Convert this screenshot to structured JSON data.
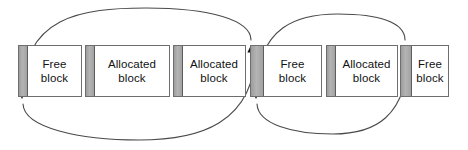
{
  "diagram": {
    "width": 468,
    "height": 150,
    "background_color": "#ffffff",
    "stroke_color": "#4a4a4a",
    "header_fill_color": "#a9a9a9",
    "block_border_color": "#6e6e6e",
    "text_color": "#111111",
    "blocks": [
      {
        "id": "block-1",
        "label": "Free\nblock",
        "type": "free",
        "x": 18,
        "y": 45,
        "width": 64,
        "height": 52,
        "header_width": 9
      },
      {
        "id": "block-2",
        "label": "Allocated\nblock",
        "type": "allocated",
        "x": 85,
        "y": 45,
        "width": 85,
        "height": 52,
        "header_width": 9
      },
      {
        "id": "block-3",
        "label": "Allocated\nblock",
        "type": "allocated",
        "x": 173,
        "y": 45,
        "width": 73,
        "height": 52,
        "header_width": 9
      },
      {
        "id": "block-4",
        "label": "Free\nblock",
        "type": "free",
        "x": 250,
        "y": 45,
        "width": 72,
        "height": 52,
        "header_width": 13
      },
      {
        "id": "block-5",
        "label": "Allocated\nblock",
        "type": "allocated",
        "x": 326,
        "y": 45,
        "width": 72,
        "height": 52,
        "header_width": 9
      },
      {
        "id": "block-6",
        "label": "Free\nblock",
        "type": "free",
        "x": 400,
        "y": 45,
        "width": 49,
        "height": 52,
        "header_width": 11
      }
    ],
    "links": [
      {
        "id": "forward-link-1",
        "direction": "forward",
        "from_block": "block-1",
        "to_block": "block-4",
        "arrow_at": "top",
        "path": "M 22 96 C 22 16, 82 8, 146 8 C 210 8, 251 20, 251 40",
        "arrow_x": 251,
        "arrow_y": 45,
        "arrow_angle": 90
      },
      {
        "id": "backward-link-1",
        "direction": "backward",
        "from_block": "block-4",
        "to_block": "block-1",
        "arrow_at": "bottom",
        "path": "M 256 46 C 256 126, 196 140, 139 140 C 80 140, 24 128, 23 104",
        "arrow_x": 22,
        "arrow_y": 99,
        "arrow_angle": -90
      },
      {
        "id": "forward-link-2",
        "direction": "forward",
        "from_block": "block-4",
        "to_block": "block-6",
        "arrow_at": "top",
        "path": "M 256 96 C 256 24, 300 14, 338 14 C 378 14, 405 22, 405 40",
        "arrow_x": 405,
        "arrow_y": 45,
        "arrow_angle": 90
      },
      {
        "id": "backward-link-2",
        "direction": "backward",
        "from_block": "block-6",
        "to_block": "block-4",
        "arrow_at": "bottom",
        "path": "M 409 46 C 409 120, 372 134, 333 134 C 292 134, 258 124, 257 104",
        "arrow_x": 256,
        "arrow_y": 99,
        "arrow_angle": -90
      }
    ]
  }
}
